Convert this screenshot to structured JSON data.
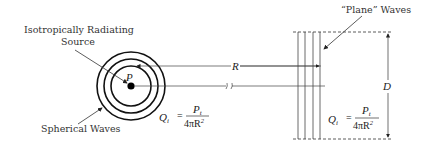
{
  "diagram": {
    "labels": {
      "source_line1": "Isotropically Radiating",
      "source_line2": "Source",
      "spherical_waves": "Spherical Waves",
      "plane_waves": "“Plane” Waves",
      "point": "P",
      "distance": "R",
      "aperture": "D",
      "break_mark": "//"
    },
    "formula_left": {
      "lhs": "Q",
      "lhs_sub": "i",
      "equals": "=",
      "numerator": "P",
      "numerator_sub": "t",
      "denominator": "4πR",
      "denominator_sup": "2"
    },
    "formula_right": {
      "lhs": "Q",
      "lhs_sub": "i",
      "equals": "=",
      "numerator": "P",
      "numerator_sub": "t",
      "denominator": "4πR",
      "denominator_sup": "2"
    },
    "colors": {
      "stroke": "#222222",
      "text": "#333333"
    }
  }
}
